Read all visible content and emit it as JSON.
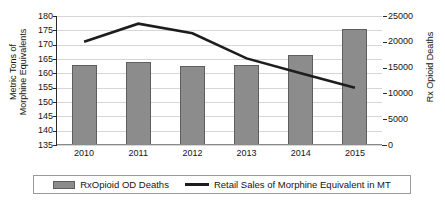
{
  "chart_data": {
    "type": "bar",
    "title": "",
    "categories": [
      "2010",
      "2011",
      "2012",
      "2013",
      "2014",
      "2015"
    ],
    "xlabel": "",
    "grid": true,
    "legend_position": "bottom",
    "axes": {
      "left": {
        "label_line1": "Metric Tons of",
        "label_line2": "Morphine Equivalents",
        "ylim": [
          135,
          180
        ],
        "step": 5,
        "ticks": [
          "180",
          "175",
          "170",
          "165",
          "160",
          "155",
          "150",
          "145",
          "140",
          "135"
        ]
      },
      "right": {
        "label": "Rx Opioid Deaths",
        "ylim": [
          0,
          25000
        ],
        "step": 5000,
        "ticks": [
          "25000",
          "20000",
          "15000",
          "10000",
          "5000",
          "0"
        ]
      }
    },
    "series": [
      {
        "name": "RxOpioid OD Deaths",
        "type": "bar",
        "axis": "right",
        "color": "#8c8c8c",
        "values": [
          15500,
          16000,
          15250,
          15500,
          17500,
          22500
        ]
      },
      {
        "name": "Retail Sales of Morphine Equivalent in MT",
        "type": "line",
        "axis": "left",
        "color": "#1d1d1d",
        "values": [
          171.0,
          177.3,
          174.0,
          165.2,
          160.0,
          155.0
        ]
      }
    ]
  },
  "legend": {
    "entries": [
      {
        "label": "RxOpioid OD Deaths",
        "marker": "bar-swatch-icon"
      },
      {
        "label": "Retail Sales of Morphine Equivalent in MT",
        "marker": "line-swatch-icon"
      }
    ]
  }
}
